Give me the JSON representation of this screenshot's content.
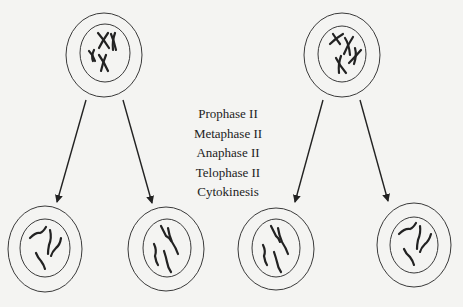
{
  "phases": [
    "Prophase II",
    "Metaphase II",
    "Anaphase II",
    "Telophase II",
    "Cytokinesis"
  ],
  "colors": {
    "background": "#f4f4f2",
    "stroke": "#222222"
  },
  "cells": {
    "parents": [
      {
        "id": "parent-left",
        "cx": 104,
        "cy": 55,
        "state": "duplicated-chromosomes"
      },
      {
        "id": "parent-right",
        "cx": 342,
        "cy": 55,
        "state": "duplicated-chromosomes"
      }
    ],
    "daughters": [
      {
        "id": "daughter-1",
        "cx": 45,
        "cy": 249,
        "state": "single-chromatids"
      },
      {
        "id": "daughter-2",
        "cx": 166,
        "cy": 249,
        "state": "single-chromatids"
      },
      {
        "id": "daughter-3",
        "cx": 276,
        "cy": 249,
        "state": "single-chromatids"
      },
      {
        "id": "daughter-4",
        "cx": 414,
        "cy": 245,
        "state": "single-chromatids"
      }
    ]
  }
}
